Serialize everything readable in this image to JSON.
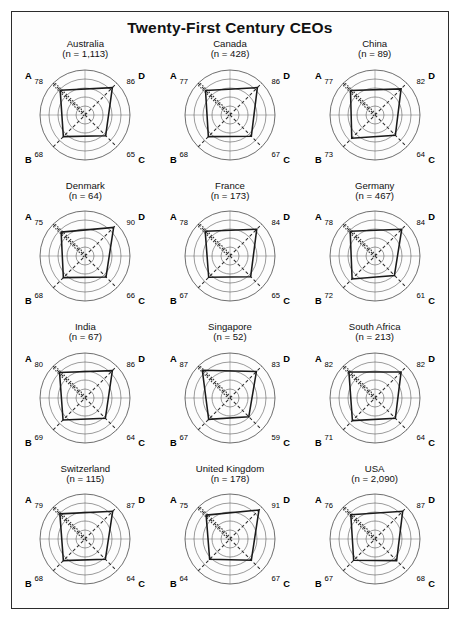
{
  "figure": {
    "title": "Twenty-First Century CEOs",
    "border_color": "#2b2b2b",
    "background": "#ffffff"
  },
  "axis_labels": {
    "a": "A",
    "b": "B",
    "c": "C",
    "d": "D"
  },
  "chart_data": {
    "type": "radar",
    "title": "Twenty-First Century CEOs",
    "axes": [
      "A",
      "B",
      "C",
      "D"
    ],
    "axis_positions": {
      "A": "upper-left",
      "D": "upper-right",
      "B": "lower-left",
      "C": "lower-right"
    },
    "rings": 5,
    "radial_range": [
      0,
      100
    ],
    "grid": true,
    "legend": "none",
    "value_label_note": "Each axis value is printed at the outer end of its spoke.",
    "panels": [
      {
        "name": "Australia",
        "n_label": "(n = 1,113)",
        "n": 1113,
        "values": {
          "A": 78,
          "B": 68,
          "C": 65,
          "D": 86
        }
      },
      {
        "name": "Canada",
        "n_label": "(n = 428)",
        "n": 428,
        "values": {
          "A": 77,
          "B": 68,
          "C": 67,
          "D": 86
        }
      },
      {
        "name": "China",
        "n_label": "(n = 89)",
        "n": 89,
        "values": {
          "A": 77,
          "B": 73,
          "C": 64,
          "D": 82
        }
      },
      {
        "name": "Denmark",
        "n_label": "(n = 64)",
        "n": 64,
        "values": {
          "A": 75,
          "B": 68,
          "C": 66,
          "D": 90
        }
      },
      {
        "name": "France",
        "n_label": "(n = 173)",
        "n": 173,
        "values": {
          "A": 78,
          "B": 67,
          "C": 65,
          "D": 84
        }
      },
      {
        "name": "Germany",
        "n_label": "(n = 467)",
        "n": 467,
        "values": {
          "A": 78,
          "B": 72,
          "C": 61,
          "D": 84
        }
      },
      {
        "name": "India",
        "n_label": "(n = 67)",
        "n": 67,
        "values": {
          "A": 80,
          "B": 69,
          "C": 64,
          "D": 86
        }
      },
      {
        "name": "Singapore",
        "n_label": "(n = 52)",
        "n": 52,
        "values": {
          "A": 87,
          "B": 67,
          "C": 59,
          "D": 83
        }
      },
      {
        "name": "South Africa",
        "n_label": "(n = 213)",
        "n": 213,
        "values": {
          "A": 82,
          "B": 71,
          "C": 64,
          "D": 82
        }
      },
      {
        "name": "Switzerland",
        "n_label": "(n = 115)",
        "n": 115,
        "values": {
          "A": 79,
          "B": 68,
          "C": 64,
          "D": 87
        }
      },
      {
        "name": "United Kingdom",
        "n_label": "(n = 178)",
        "n": 178,
        "values": {
          "A": 75,
          "B": 64,
          "C": 67,
          "D": 91
        }
      },
      {
        "name": "USA",
        "n_label": "(n = 2,090)",
        "n": 2090,
        "values": {
          "A": 76,
          "B": 67,
          "C": 68,
          "D": 87
        }
      }
    ]
  }
}
